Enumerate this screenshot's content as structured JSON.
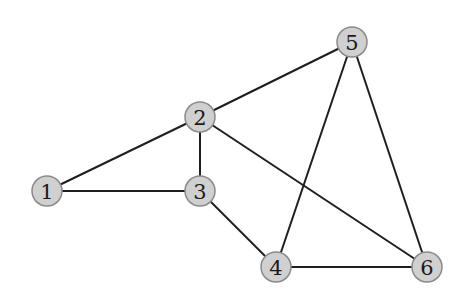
{
  "graph": {
    "nodes": [
      {
        "id": "1",
        "label": "1",
        "x": 47,
        "y": 191
      },
      {
        "id": "2",
        "label": "2",
        "x": 200,
        "y": 117
      },
      {
        "id": "3",
        "label": "3",
        "x": 200,
        "y": 191
      },
      {
        "id": "4",
        "label": "4",
        "x": 276,
        "y": 267
      },
      {
        "id": "5",
        "label": "5",
        "x": 352,
        "y": 42
      },
      {
        "id": "6",
        "label": "6",
        "x": 427,
        "y": 267
      }
    ],
    "edges": [
      {
        "from": "1",
        "to": "2"
      },
      {
        "from": "1",
        "to": "3"
      },
      {
        "from": "2",
        "to": "3"
      },
      {
        "from": "2",
        "to": "5"
      },
      {
        "from": "2",
        "to": "6"
      },
      {
        "from": "3",
        "to": "4"
      },
      {
        "from": "4",
        "to": "5"
      },
      {
        "from": "4",
        "to": "6"
      },
      {
        "from": "5",
        "to": "6"
      }
    ],
    "node_radius": 15,
    "colors": {
      "node_fill": "#d0d0d0",
      "node_stroke": "#8a8a8a",
      "edge": "#1e1e1e",
      "label": "#1a1a1a"
    }
  }
}
